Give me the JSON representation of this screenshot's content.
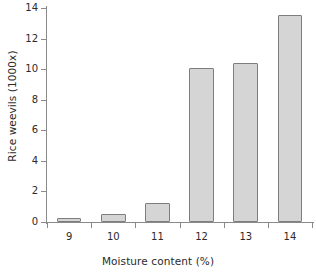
{
  "chart_data": {
    "type": "bar",
    "title": "",
    "xlabel": "Moisture content (%)",
    "ylabel": "Rice weevils (1000x)",
    "categories": [
      "9",
      "10",
      "11",
      "12",
      "13",
      "14"
    ],
    "values": [
      0.15,
      0.5,
      1.25,
      10.1,
      10.4,
      13.55
    ],
    "series": [
      {
        "name": "Rice weevils",
        "values": [
          0.15,
          0.5,
          1.25,
          10.1,
          10.4,
          13.55
        ]
      }
    ],
    "ylim": [
      0,
      14
    ],
    "ytick_labels": [
      "0",
      "2",
      "4",
      "6",
      "8",
      "10",
      "12",
      "14"
    ],
    "ytick_values": [
      0,
      2,
      4,
      6,
      8,
      10,
      12,
      14
    ],
    "xtick_labels": [
      "9",
      "10",
      "11",
      "12",
      "13",
      "14"
    ],
    "grid": false,
    "legend": false,
    "legend_position": "none",
    "bar_fill_color": "#d5d5d5",
    "bar_border_color": "#7d7d7d",
    "axis_color": "#8a8a8a",
    "background_color": "#ffffff",
    "text_color": "#2b2b2b"
  }
}
